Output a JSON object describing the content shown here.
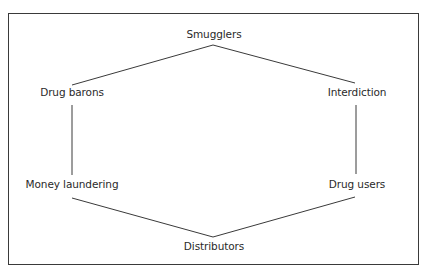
{
  "diagram": {
    "type": "hexagon-cycle",
    "nodes": [
      {
        "id": "smugglers",
        "label": "Smugglers"
      },
      {
        "id": "interdiction",
        "label": "Interdiction"
      },
      {
        "id": "drug_users",
        "label": "Drug users"
      },
      {
        "id": "distributors",
        "label": "Distributors"
      },
      {
        "id": "money_laundering",
        "label": "Money laundering"
      },
      {
        "id": "drug_barons",
        "label": "Drug barons"
      }
    ],
    "edges": [
      [
        "smugglers",
        "interdiction"
      ],
      [
        "interdiction",
        "drug_users"
      ],
      [
        "drug_users",
        "distributors"
      ],
      [
        "distributors",
        "money_laundering"
      ],
      [
        "money_laundering",
        "drug_barons"
      ],
      [
        "drug_barons",
        "smugglers"
      ]
    ],
    "line_color": "#3a3a3a",
    "border_color": "#3a3a3a"
  }
}
